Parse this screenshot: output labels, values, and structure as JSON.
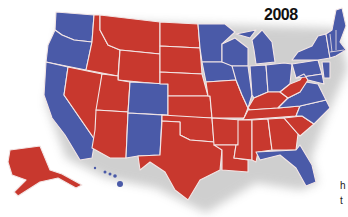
{
  "title": "2008",
  "colors": {
    "democrat": "#4a5aa8",
    "republican": "#c8382e",
    "border": "#f3e6e6"
  },
  "edge_text": [
    "h",
    "t"
  ],
  "states": {
    "blue": [
      "WA",
      "OR",
      "CA",
      "NV",
      "CO",
      "NM",
      "MN",
      "IA",
      "WI",
      "IL",
      "MI",
      "IN",
      "OH",
      "PA",
      "NY",
      "VA",
      "NC",
      "FL",
      "ME",
      "NH",
      "VT",
      "MA",
      "CT",
      "RI",
      "NJ",
      "DE",
      "MD",
      "HI"
    ],
    "red": [
      "AK",
      "ID",
      "MT",
      "WY",
      "UT",
      "AZ",
      "ND",
      "SD",
      "NE",
      "KS",
      "OK",
      "TX",
      "MO",
      "AR",
      "LA",
      "MS",
      "AL",
      "GA",
      "SC",
      "TN",
      "KY",
      "WV"
    ]
  }
}
